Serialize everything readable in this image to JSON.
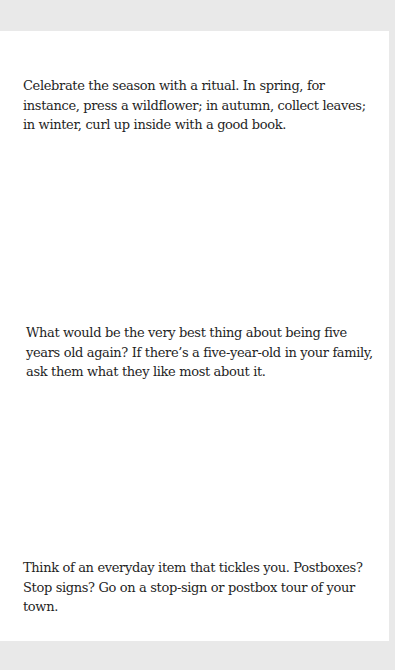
{
  "page": {
    "background": "#e9e9e9",
    "sheet_color": "#ffffff",
    "text_color": "#1f1f1f"
  },
  "prompts": [
    {
      "text": "Celebrate the season with a ritual. In spring, for instance, press a wildflower; in autumn, collect leaves; in winter, curl up inside with a good book."
    },
    {
      "text": "What would be the very best thing about being five years old again? If there’s a five-year-old in your family, ask them what they like most about it."
    },
    {
      "text": "Think of an everyday item that tickles you. Postboxes? Stop signs? Go on a stop-sign or postbox tour of your town."
    }
  ]
}
